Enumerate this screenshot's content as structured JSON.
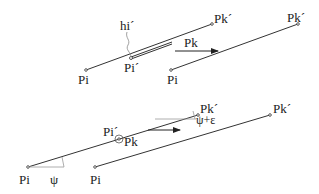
{
  "top_diagram": {
    "left": {
      "start_label": "Pi",
      "mid_label": "Pi´",
      "end_label": "Pk´",
      "height_label": "hi´"
    },
    "moving_label": "Pk",
    "right": {
      "start_label": "Pi",
      "end_label": "Pk´"
    }
  },
  "bottom_diagram": {
    "left": {
      "start_label": "Pi",
      "mid_label": "Pi´",
      "mid_target_label": "Pk",
      "end_label": "Pk´",
      "angle_label": "ψ",
      "end_angle_label": "ψ+ε"
    },
    "right": {
      "start_label": "Pi",
      "end_label": "Pk´"
    }
  },
  "colors": {
    "line": "#333333",
    "guide": "#999999",
    "text": "#222222"
  }
}
